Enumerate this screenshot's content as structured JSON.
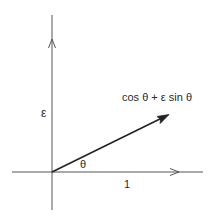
{
  "diagram": {
    "type": "vector-diagram",
    "colors": {
      "background": "#ffffff",
      "axis": "#555555",
      "vector": "#222222",
      "text": "#2a2a2a"
    },
    "origin": {
      "x": 52,
      "y": 172
    },
    "axes": {
      "horizontal": {
        "x1": 12,
        "x2": 203,
        "y": 172,
        "arrow_at_x": 178
      },
      "vertical": {
        "x": 52,
        "y1": 15,
        "y2": 210,
        "arrow_at_y": 40
      }
    },
    "vector": {
      "x1": 52,
      "y1": 172,
      "x2": 168,
      "y2": 115
    },
    "labels": {
      "vertical_axis": "ε",
      "horizontal_unit": "1",
      "angle": "θ",
      "vector": "cos θ + ε sin θ"
    }
  }
}
